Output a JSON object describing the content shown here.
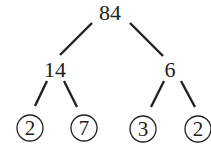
{
  "diagram": {
    "type": "factor-tree",
    "root": {
      "label": "84"
    },
    "level1": [
      {
        "label": "14"
      },
      {
        "label": "6"
      }
    ],
    "leaves": [
      {
        "label": "2",
        "circled": true
      },
      {
        "label": "7",
        "circled": true
      },
      {
        "label": "3",
        "circled": true
      },
      {
        "label": "2",
        "circled": true
      }
    ],
    "colors": {
      "ink": "#222222",
      "background": "#ffffff"
    }
  }
}
